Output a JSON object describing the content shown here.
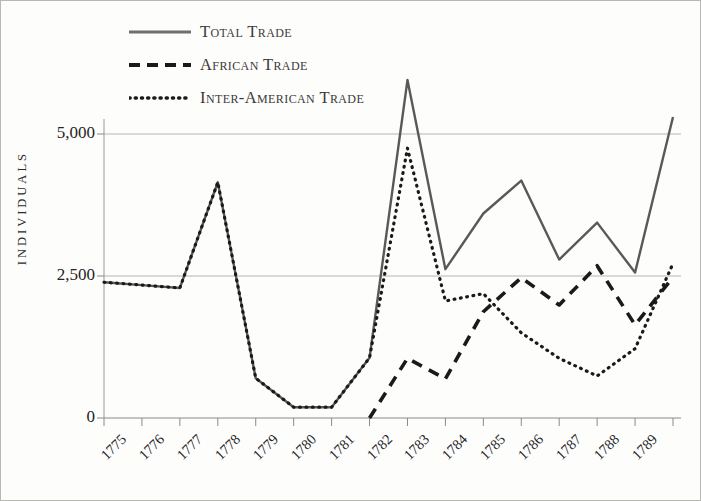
{
  "chart_data": {
    "type": "line",
    "title": "",
    "xlabel": "",
    "ylabel": "INDIVIDUALS",
    "x": [
      1775,
      1776,
      1777,
      1778,
      1779,
      1780,
      1781,
      1782,
      1783,
      1784,
      1785,
      1786,
      1787,
      1788,
      1789,
      1790
    ],
    "xtick_labels": [
      "1775",
      "1776",
      "1777",
      "1778",
      "1779",
      "1780",
      "1781",
      "1782",
      "1783",
      "1784",
      "1785",
      "1786",
      "1787",
      "1788",
      "1789"
    ],
    "ytick_labels": [
      "0",
      "2,500",
      "5,000"
    ],
    "ytick_values": [
      0,
      2500,
      5000
    ],
    "ylim": [
      0,
      6200
    ],
    "xlim": [
      1775,
      1790
    ],
    "grid": "horizontal",
    "legend_position": "top-left",
    "series": [
      {
        "name": "Total Trade",
        "style": "solid",
        "color": "#595959",
        "values": [
          2390,
          2340,
          2290,
          4150,
          700,
          190,
          190,
          1060,
          5950,
          2620,
          3600,
          4180,
          2790,
          3440,
          2560,
          5300
        ]
      },
      {
        "name": "African Trade",
        "style": "dashed",
        "color": "#1a1a1a",
        "values": [
          0,
          0,
          0,
          0,
          0,
          0,
          0,
          0,
          1050,
          690,
          1870,
          2470,
          1990,
          2680,
          1640,
          2480
        ]
      },
      {
        "name": "Inter-American Trade",
        "style": "dotted",
        "color": "#1a1a1a",
        "values": [
          2390,
          2340,
          2290,
          4150,
          700,
          190,
          190,
          1060,
          4750,
          2060,
          2190,
          1500,
          1050,
          740,
          1220,
          2720
        ]
      }
    ]
  },
  "legend": {
    "items": [
      {
        "label": "Total Trade",
        "style": "solid"
      },
      {
        "label": "African Trade",
        "style": "dashed"
      },
      {
        "label": "Inter-American Trade",
        "style": "dotted"
      }
    ]
  },
  "axis": {
    "y_title": "INDIVIDUALS"
  }
}
